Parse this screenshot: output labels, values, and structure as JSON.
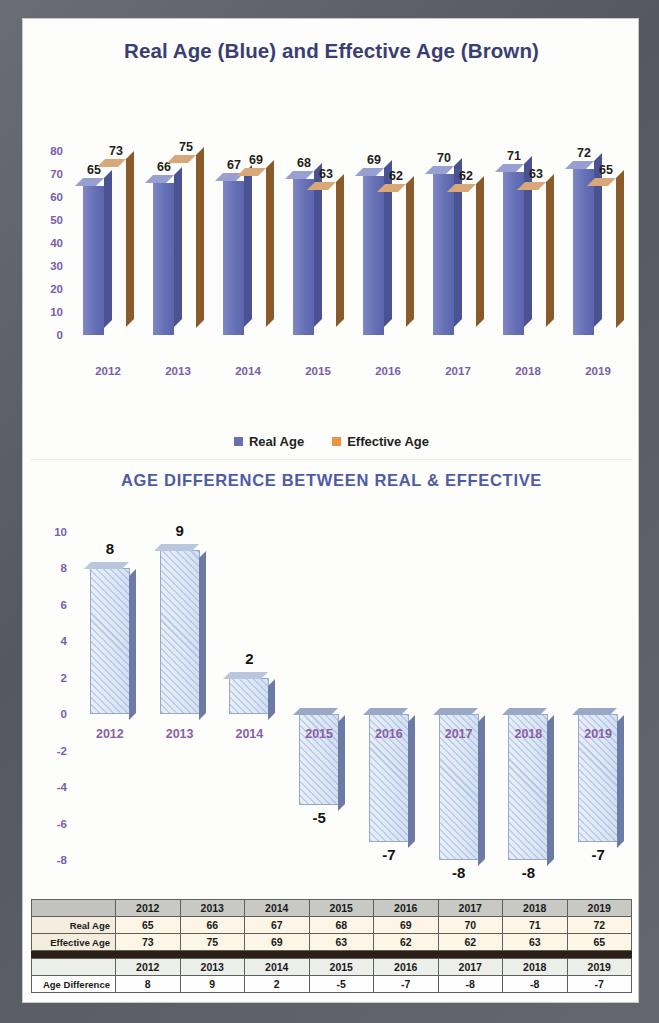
{
  "page": {
    "frame_color": "#5d6066",
    "background": "#fdfdfc"
  },
  "chart1": {
    "title": "Real Age (Blue) and Effective Age (Brown)",
    "legend": [
      {
        "label": "Real Age",
        "color": "#6670b5"
      },
      {
        "label": "Effective Age",
        "color": "#ec9440"
      }
    ]
  },
  "chart2": {
    "title": "AGE DIFFERENCE BETWEEN REAL & EFFECTIVE"
  },
  "tables": {
    "table1": {
      "corner": "",
      "years": [
        "2012",
        "2013",
        "2014",
        "2015",
        "2016",
        "2017",
        "2018",
        "2019"
      ],
      "rows": [
        {
          "label": "Real Age",
          "values": [
            "65",
            "66",
            "67",
            "68",
            "69",
            "70",
            "71",
            "72"
          ]
        },
        {
          "label": "Effective Age",
          "values": [
            "73",
            "75",
            "69",
            "63",
            "62",
            "62",
            "63",
            "65"
          ]
        }
      ]
    },
    "table2": {
      "corner": "",
      "years": [
        "2012",
        "2013",
        "2014",
        "2015",
        "2016",
        "2017",
        "2018",
        "2019"
      ],
      "rows": [
        {
          "label": "Age Difference",
          "values": [
            "8",
            "9",
            "2",
            "-5",
            "-7",
            "-8",
            "-8",
            "-7"
          ]
        }
      ]
    }
  },
  "chart_data": [
    {
      "type": "bar",
      "title": "Real Age (Blue) and Effective Age (Brown)",
      "xlabel": "",
      "ylabel": "",
      "ylim": [
        0,
        80
      ],
      "yticks": [
        0,
        10,
        20,
        30,
        40,
        50,
        60,
        70,
        80
      ],
      "ytick_labels": [
        "0",
        "10",
        "20",
        "30",
        "40",
        "50",
        "60",
        "70",
        "80"
      ],
      "categories": [
        "2012",
        "2013",
        "2014",
        "2015",
        "2016",
        "2017",
        "2018",
        "2019"
      ],
      "grid": false,
      "legend_position": "bottom",
      "three_d": true,
      "series": [
        {
          "name": "Real Age",
          "color": "#6670b5",
          "values": [
            65,
            66,
            67,
            68,
            69,
            70,
            71,
            72
          ]
        },
        {
          "name": "Effective Age",
          "color": "#ec9440",
          "values": [
            73,
            75,
            69,
            63,
            62,
            62,
            63,
            65
          ]
        }
      ]
    },
    {
      "type": "bar",
      "title": "AGE DIFFERENCE BETWEEN REAL & EFFECTIVE",
      "xlabel": "",
      "ylabel": "",
      "ylim": [
        -8,
        10
      ],
      "yticks": [
        -8,
        -6,
        -4,
        -2,
        0,
        2,
        4,
        6,
        8,
        10
      ],
      "ytick_labels": [
        "-8",
        "-6",
        "-4",
        "-2",
        "0",
        "2",
        "4",
        "6",
        "8",
        "10"
      ],
      "categories": [
        "2012",
        "2013",
        "2014",
        "2015",
        "2016",
        "2017",
        "2018",
        "2019"
      ],
      "grid": false,
      "legend_position": "none",
      "three_d": true,
      "series": [
        {
          "name": "Age Difference",
          "color": "#dde8f6",
          "values": [
            8,
            9,
            2,
            -5,
            -7,
            -8,
            -8,
            -7
          ]
        }
      ]
    }
  ]
}
